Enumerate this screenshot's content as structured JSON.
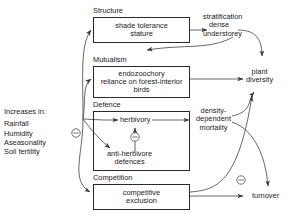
{
  "diagram": {
    "type": "causal-flow-diagram",
    "source": {
      "header": "Increases in:",
      "items": [
        "Rainfall",
        "Humidity",
        "Aseasonality",
        "Soil fertility"
      ]
    },
    "groups": [
      {
        "id": "structure",
        "label": "Structure",
        "lines": [
          "shade tolerance",
          "stature"
        ]
      },
      {
        "id": "mutualism",
        "label": "Mutualism",
        "lines": [
          "endozoochory",
          "reliance on forest-interior",
          "birds"
        ]
      },
      {
        "id": "defence",
        "label": "Defence",
        "lines": [
          "herbivory",
          "anti-herbivore",
          "defences"
        ]
      },
      {
        "id": "competition",
        "label": "Competition",
        "lines": [
          "competitive",
          "exclusion"
        ]
      }
    ],
    "defence_nodes": {
      "herbivory": "herbivory",
      "anti_herbivore": "anti-herbivore\ndefences",
      "anti_herbivore_line1": "anti-herbivore",
      "anti_herbivore_line2": "defences"
    },
    "outcomes": [
      {
        "id": "stratification",
        "lines": [
          "stratification",
          "dense",
          "understorey"
        ]
      },
      {
        "id": "plant-diversity",
        "lines": [
          "plant",
          "diversity"
        ]
      },
      {
        "id": "density-dependent-mortality",
        "lines": [
          "density-",
          "dependent",
          "mortality"
        ]
      },
      {
        "id": "turnover",
        "lines": [
          "turnover"
        ]
      }
    ],
    "signs": {
      "negative_symbol": "−",
      "negative_links": [
        "increases-in → anti-herbivore defences",
        "anti-herbivore defences → herbivory",
        "competitive exclusion → plant diversity"
      ]
    },
    "colors": {
      "line": "#4a4a4a",
      "box_border": "#2a2a2a",
      "text": "#1a1a1a",
      "background": "#ffffff"
    }
  }
}
